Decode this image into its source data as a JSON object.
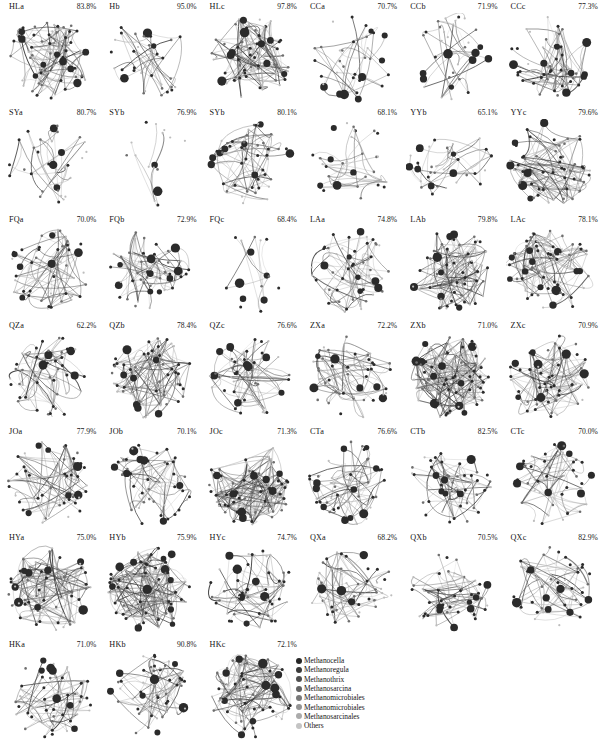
{
  "figure": {
    "title": "",
    "rows": 7,
    "columns": 6
  },
  "panels": [
    {
      "label": "HLa",
      "percent": "83.8%",
      "density": "high",
      "seed": 11
    },
    {
      "label": "Hb",
      "percent": "95.0%",
      "density": "low",
      "seed": 12
    },
    {
      "label": "HLc",
      "percent": "97.8%",
      "density": "high",
      "seed": 13
    },
    {
      "label": "CCa",
      "percent": "70.7%",
      "density": "low",
      "seed": 14
    },
    {
      "label": "CCb",
      "percent": "71.9%",
      "density": "low",
      "seed": 15
    },
    {
      "label": "CCc",
      "percent": "77.3%",
      "density": "medium",
      "seed": 16
    },
    {
      "label": "SYa",
      "percent": "80.7%",
      "density": "low",
      "seed": 21
    },
    {
      "label": "SYb",
      "percent": "76.9%",
      "density": "sparse",
      "seed": 22
    },
    {
      "label": "SYb",
      "percent": "80.1%",
      "density": "medium",
      "seed": 23
    },
    {
      "label": "",
      "percent": "68.1%",
      "density": "low",
      "seed": 24
    },
    {
      "label": "YYb",
      "percent": "65.1%",
      "density": "low",
      "seed": 25
    },
    {
      "label": "YYc",
      "percent": "79.6%",
      "density": "high",
      "seed": 26
    },
    {
      "label": "FQa",
      "percent": "70.0%",
      "density": "medium",
      "seed": 31
    },
    {
      "label": "FQb",
      "percent": "72.9%",
      "density": "medium",
      "seed": 32
    },
    {
      "label": "FQc",
      "percent": "68.4%",
      "density": "sparse",
      "seed": 33
    },
    {
      "label": "LAa",
      "percent": "74.8%",
      "density": "medium",
      "seed": 34
    },
    {
      "label": "LAb",
      "percent": "79.8%",
      "density": "high",
      "seed": 35
    },
    {
      "label": "LAc",
      "percent": "78.1%",
      "density": "high",
      "seed": 36
    },
    {
      "label": "QZa",
      "percent": "62.2%",
      "density": "medium",
      "seed": 41
    },
    {
      "label": "QZb",
      "percent": "78.4%",
      "density": "high",
      "seed": 42
    },
    {
      "label": "QZc",
      "percent": "76.6%",
      "density": "medium",
      "seed": 43
    },
    {
      "label": "ZXa",
      "percent": "72.2%",
      "density": "medium",
      "seed": 44
    },
    {
      "label": "ZXb",
      "percent": "71.0%",
      "density": "veryhigh",
      "seed": 45
    },
    {
      "label": "ZXc",
      "percent": "70.9%",
      "density": "high",
      "seed": 46
    },
    {
      "label": "JOa",
      "percent": "77.9%",
      "density": "medium",
      "seed": 51
    },
    {
      "label": "JOb",
      "percent": "70.1%",
      "density": "medium",
      "seed": 52
    },
    {
      "label": "JOc",
      "percent": "71.3%",
      "density": "veryhigh",
      "seed": 53
    },
    {
      "label": "CTa",
      "percent": "76.6%",
      "density": "medium",
      "seed": 54
    },
    {
      "label": "CTb",
      "percent": "82.5%",
      "density": "medium",
      "seed": 55
    },
    {
      "label": "CTc",
      "percent": "70.0%",
      "density": "medium",
      "seed": 56
    },
    {
      "label": "HYa",
      "percent": "75.0%",
      "density": "high",
      "seed": 61
    },
    {
      "label": "HYb",
      "percent": "75.9%",
      "density": "veryhigh",
      "seed": 62
    },
    {
      "label": "HYc",
      "percent": "74.7%",
      "density": "medium",
      "seed": 63
    },
    {
      "label": "QXa",
      "percent": "68.2%",
      "density": "medium",
      "seed": 64
    },
    {
      "label": "QXb",
      "percent": "70.5%",
      "density": "medium",
      "seed": 65
    },
    {
      "label": "QXc",
      "percent": "82.9%",
      "density": "medium",
      "seed": 66
    },
    {
      "label": "HKa",
      "percent": "71.0%",
      "density": "medium",
      "seed": 71
    },
    {
      "label": "HKb",
      "percent": "90.8%",
      "density": "medium",
      "seed": 72
    },
    {
      "label": "HKc",
      "percent": "72.1%",
      "density": "high",
      "seed": 73
    },
    {
      "label": "",
      "percent": "",
      "density": "",
      "seed": 0
    },
    {
      "label": "",
      "percent": "",
      "density": "",
      "seed": 0
    },
    {
      "label": "",
      "percent": "",
      "density": "",
      "seed": 0
    }
  ],
  "legend": {
    "items": [
      {
        "label": "Methanocella",
        "color": "#262626"
      },
      {
        "label": "Methanoregula",
        "color": "#3a3a3a"
      },
      {
        "label": "Methanothrix",
        "color": "#4e4e4e"
      },
      {
        "label": "Methanosarcina",
        "color": "#636363"
      },
      {
        "label": "Methanomicrobiales",
        "color": "#797979"
      },
      {
        "label": "Methanomicrobiales",
        "color": "#949494"
      },
      {
        "label": "Methanosarcinales",
        "color": "#ababab"
      },
      {
        "label": "Others",
        "color": "#c4c4c4"
      }
    ]
  },
  "colors": {
    "background": "#ffffff",
    "node_dark": "#2b2b2b",
    "node_mid": "#6e6e6e",
    "node_light": "#bdbdbd",
    "edge": "#7a7a7a"
  }
}
